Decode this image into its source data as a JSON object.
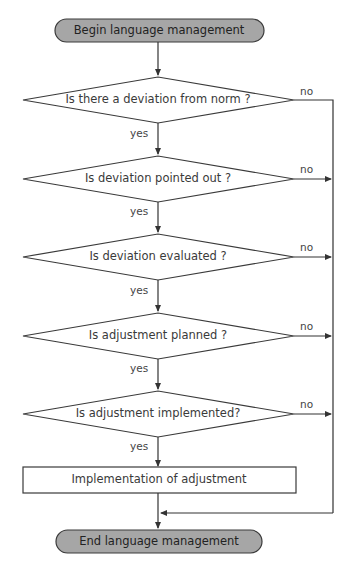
{
  "diagram": {
    "type": "flowchart",
    "start": {
      "label": "Begin language management"
    },
    "decisions": [
      {
        "label": "Is there a deviation from norm ?",
        "yes": "yes",
        "no": "no"
      },
      {
        "label": "Is deviation pointed out ?",
        "yes": "yes",
        "no": "no"
      },
      {
        "label": "Is deviation evaluated ?",
        "yes": "yes",
        "no": "no"
      },
      {
        "label": "Is adjustment planned ?",
        "yes": "yes",
        "no": "no"
      },
      {
        "label": "Is adjustment implemented?",
        "yes": "yes",
        "no": "no"
      }
    ],
    "process": {
      "label": "Implementation of adjustment"
    },
    "end": {
      "label": "End language management"
    },
    "colors": {
      "terminal_fill": "#a6a6a6",
      "stroke": "#3a3a3a",
      "background": "#ffffff"
    }
  }
}
